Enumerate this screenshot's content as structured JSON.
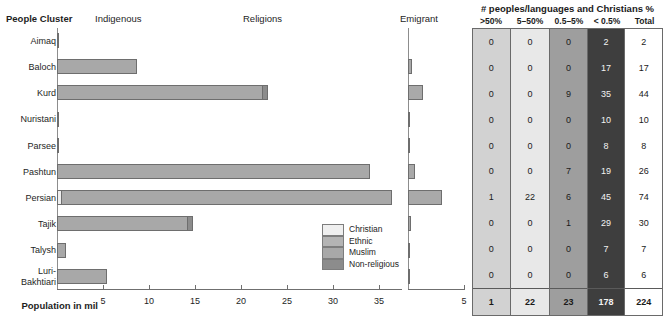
{
  "headers": {
    "people_cluster": "People Cluster",
    "indigenous": "Indigenous",
    "religions": "Religions",
    "emigrant": "Emigrant",
    "axis_caption": "Population in mil"
  },
  "legend": {
    "items": [
      {
        "label": "Christian",
        "color": "#efefef"
      },
      {
        "label": "Ethnic",
        "color": "#b4b4b4"
      },
      {
        "label": "Muslim",
        "color": "#a8a8a8"
      },
      {
        "label": "Non-religious",
        "color": "#8c8c8c"
      }
    ]
  },
  "table": {
    "title": "# peoples/languages and Christians %",
    "columns": [
      {
        "label": ">50%",
        "color": "#d2d2d2",
        "text": "#1a1a1a"
      },
      {
        "label": "5–50%",
        "color": "#e8e8e8",
        "text": "#1a1a1a"
      },
      {
        "label": "0.5–5%",
        "color": "#9e9e9e",
        "text": "#1a1a1a"
      },
      {
        "label": "< 0.5%",
        "color": "#3e3e3e",
        "text": "#f2f2f2"
      },
      {
        "label": "Total",
        "color": "#ffffff",
        "text": "#1a1a1a"
      }
    ],
    "rows": [
      {
        "name": "Aimaq",
        "values": [
          "0",
          "0",
          "0",
          "2",
          "2"
        ]
      },
      {
        "name": "Baloch",
        "values": [
          "0",
          "0",
          "0",
          "17",
          "17"
        ]
      },
      {
        "name": "Kurd",
        "values": [
          "0",
          "0",
          "9",
          "35",
          "44"
        ]
      },
      {
        "name": "Nuristani",
        "values": [
          "0",
          "0",
          "0",
          "10",
          "10"
        ]
      },
      {
        "name": "Parsee",
        "values": [
          "0",
          "0",
          "0",
          "8",
          "8"
        ]
      },
      {
        "name": "Pashtun",
        "values": [
          "0",
          "0",
          "7",
          "19",
          "26"
        ]
      },
      {
        "name": "Persian",
        "values": [
          "1",
          "22",
          "6",
          "45",
          "74"
        ]
      },
      {
        "name": "Tajik",
        "values": [
          "0",
          "0",
          "1",
          "29",
          "30"
        ]
      },
      {
        "name": "Talysh",
        "values": [
          "0",
          "0",
          "0",
          "7",
          "7"
        ]
      },
      {
        "name": "Luri-Bakhtiari",
        "values": [
          "0",
          "0",
          "0",
          "6",
          "6"
        ]
      }
    ],
    "totals": [
      "1",
      "22",
      "23",
      "178",
      "224"
    ]
  },
  "chart_data": {
    "type": "bar",
    "xlabel": "Population in mil",
    "ylabel": "People Cluster",
    "categories": [
      "Aimaq",
      "Baloch",
      "Kurd",
      "Nuristani",
      "Parsee",
      "Pashtun",
      "Persian",
      "Tajik",
      "Talysh",
      "Luri-Bakhtiari"
    ],
    "category_labels": [
      [
        "Aimaq"
      ],
      [
        "Baloch"
      ],
      [
        "Kurd"
      ],
      [
        "Nuristani"
      ],
      [
        "Parsee"
      ],
      [
        "Pashtun"
      ],
      [
        "Persian"
      ],
      [
        "Tajik"
      ],
      [
        "Talysh"
      ],
      [
        "Luri-",
        "Bakhtiari"
      ]
    ],
    "grid": false,
    "legend_position": "inside-bottom-right",
    "panels": [
      {
        "name": "population",
        "xlim": [
          0,
          37.5
        ],
        "ticks": [
          5,
          10,
          15,
          20,
          25,
          30,
          35
        ],
        "tick_labels": [
          "5",
          "10",
          "15",
          "20",
          "25",
          "30",
          "35"
        ],
        "stacked_series": [
          "Christian",
          "Ethnic",
          "Muslim",
          "Non-religious"
        ],
        "bars": [
          {
            "category": "Aimaq",
            "total": 0.15,
            "segments": [
              {
                "series": "Muslim",
                "value": 0.15
              }
            ]
          },
          {
            "category": "Baloch",
            "total": 8.7,
            "segments": [
              {
                "series": "Muslim",
                "value": 8.7
              }
            ]
          },
          {
            "category": "Kurd",
            "total": 22.9,
            "segments": [
              {
                "series": "Muslim",
                "value": 22.5
              },
              {
                "series": "Non-religious",
                "value": 0.4
              }
            ]
          },
          {
            "category": "Nuristani",
            "total": 0.12,
            "segments": [
              {
                "series": "Muslim",
                "value": 0.12
              }
            ]
          },
          {
            "category": "Parsee",
            "total": 0.1,
            "segments": [
              {
                "series": "Muslim",
                "value": 0.1
              }
            ]
          },
          {
            "category": "Pashtun",
            "total": 34.0,
            "segments": [
              {
                "series": "Muslim",
                "value": 34.0
              }
            ]
          },
          {
            "category": "Persian",
            "total": 36.4,
            "segments": [
              {
                "series": "Christian",
                "value": 0.35
              },
              {
                "series": "Muslim",
                "value": 36.05
              }
            ]
          },
          {
            "category": "Tajik",
            "total": 14.8,
            "segments": [
              {
                "series": "Muslim",
                "value": 14.3
              },
              {
                "series": "Non-religious",
                "value": 0.5
              }
            ]
          },
          {
            "category": "Talysh",
            "total": 1.0,
            "segments": [
              {
                "series": "Muslim",
                "value": 1.0
              }
            ]
          },
          {
            "category": "Luri-Bakhtiari",
            "total": 5.4,
            "segments": [
              {
                "series": "Muslim",
                "value": 5.4
              }
            ]
          }
        ]
      },
      {
        "name": "emigrant",
        "xlim": [
          0,
          5
        ],
        "ticks": [
          5
        ],
        "tick_labels": [
          "5"
        ],
        "values": [
          0.0,
          0.35,
          1.35,
          0.1,
          0.12,
          0.65,
          3.0,
          0.3,
          0.04,
          0.05
        ]
      }
    ]
  }
}
